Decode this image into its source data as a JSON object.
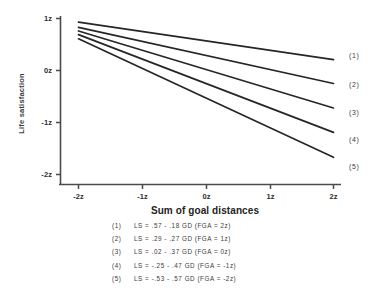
{
  "chart_data": {
    "type": "line",
    "title": "",
    "xlabel": "Sum of goal distances",
    "ylabel": "Life satisfaction",
    "xlim": [
      -2,
      2
    ],
    "ylim": [
      -2,
      1
    ],
    "xticks": [
      "-2z",
      "-1z",
      "0z",
      "1z",
      "2z"
    ],
    "xtickvals": [
      -2,
      -1,
      0,
      1,
      2
    ],
    "yticks": [
      "1z",
      "0z",
      "-1z",
      "-2z"
    ],
    "ytickvals": [
      1,
      0,
      -1,
      -2
    ],
    "grid": false,
    "legend_position": "below-plot",
    "x": [
      -2,
      2
    ],
    "series": [
      {
        "name": "(1)",
        "intercept": 0.57,
        "slope": -0.18,
        "values": [
          0.93,
          0.21
        ],
        "end_label": "(1)",
        "equation": "LS =  .57 -  .18 GD  (FGA =  2z)"
      },
      {
        "name": "(2)",
        "intercept": 0.29,
        "slope": -0.27,
        "values": [
          0.83,
          -0.25
        ],
        "end_label": "(2)",
        "equation": "LS =  .29 -  .27 GD  (FGA =  1z)"
      },
      {
        "name": "(3)",
        "intercept": 0.02,
        "slope": -0.37,
        "values": [
          0.76,
          -0.72
        ],
        "end_label": "(3)",
        "equation": "LS =  .02 -  .37 GD  (FGA =  0z)"
      },
      {
        "name": "(4)",
        "intercept": -0.25,
        "slope": -0.47,
        "values": [
          0.69,
          -1.19
        ],
        "end_label": "(4)",
        "equation": "LS = -.25 -  .47 GD  (FGA = -1z)"
      },
      {
        "name": "(5)",
        "intercept": -0.53,
        "slope": -0.57,
        "values": [
          0.61,
          -1.67
        ],
        "end_label": "(5)",
        "equation": "LS = -.53 -  .57 GD  (FGA = -2z)"
      }
    ]
  },
  "axes": {
    "ylabel": "Life satisfaction",
    "xlabel": "Sum of goal distances",
    "ytick_labels": [
      "1z",
      "0z",
      "-1z",
      "-2z"
    ],
    "xtick_labels": [
      "-2z",
      "-1z",
      "0z",
      "1z",
      "2z"
    ]
  },
  "legend": {
    "rows": [
      {
        "tag": "(1)",
        "equation": "LS =  .57 -  .18 GD  (FGA =  2z)"
      },
      {
        "tag": "(2)",
        "equation": "LS =  .29 -  .27 GD  (FGA =  1z)"
      },
      {
        "tag": "(3)",
        "equation": "LS =  .02 -  .37 GD  (FGA =  0z)"
      },
      {
        "tag": "(4)",
        "equation": "LS = -.25 -  .47 GD  (FGA = -1z)"
      },
      {
        "tag": "(5)",
        "equation": "LS = -.53 -  .57 GD  (FGA = -2z)"
      }
    ]
  },
  "endlabels": [
    "(1)",
    "(2)",
    "(3)",
    "(4)",
    "(5)"
  ],
  "colors": {
    "ink": "#2b2b2b",
    "line": "#262626",
    "axis": "#4a4a4a",
    "background": "#ffffff"
  }
}
